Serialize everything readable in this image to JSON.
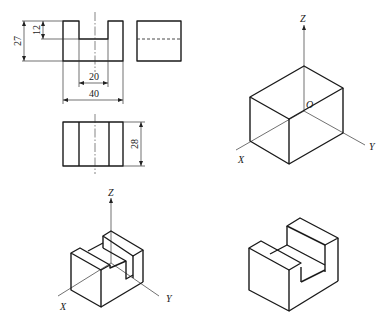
{
  "figure": {
    "orthographic": {
      "dimensions": {
        "height_total": "27",
        "notch_depth": "12",
        "notch_width": "20",
        "width_total": "40",
        "depth_total": "28"
      }
    },
    "box_axes": {
      "z": "Z",
      "origin": "O",
      "x": "X",
      "y": "Y"
    },
    "model_axes": {
      "z": "Z",
      "x": "X",
      "y": "Y"
    }
  }
}
